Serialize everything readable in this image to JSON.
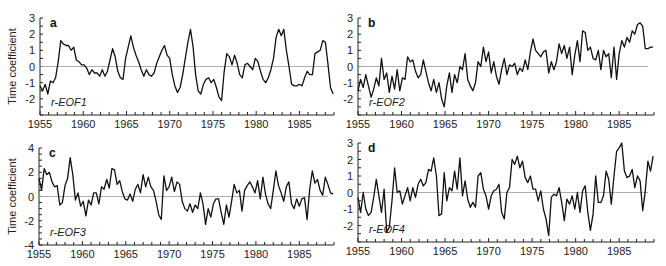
{
  "chart_data": [
    {
      "type": "line",
      "panel": "a",
      "series_label": "r-EOF1",
      "ylabel": "Time coefficient",
      "xlabel": "",
      "xlim": [
        1955,
        1989
      ],
      "ylim": [
        -3,
        3
      ],
      "xticks": [
        1955,
        1960,
        1965,
        1970,
        1975,
        1980,
        1985
      ],
      "yticks": [
        3,
        2,
        1,
        0,
        -1,
        -2
      ],
      "zero_line": true,
      "x": [
        1955.0,
        1955.3,
        1955.6,
        1955.9,
        1956.2,
        1956.5,
        1956.8,
        1957.1,
        1957.4,
        1957.7,
        1958.0,
        1958.3,
        1958.6,
        1958.9,
        1959.2,
        1959.5,
        1959.8,
        1960.1,
        1960.4,
        1960.7,
        1961.0,
        1961.3,
        1961.6,
        1961.9,
        1962.2,
        1962.5,
        1962.8,
        1963.1,
        1963.4,
        1963.7,
        1964.0,
        1964.3,
        1964.6,
        1964.9,
        1965.2,
        1965.5,
        1965.8,
        1966.1,
        1966.4,
        1966.7,
        1967.0,
        1967.3,
        1967.6,
        1967.9,
        1968.2,
        1968.5,
        1968.8,
        1969.1,
        1969.4,
        1969.7,
        1970.0,
        1970.3,
        1970.6,
        1970.9,
        1971.2,
        1971.5,
        1971.8,
        1972.1,
        1972.4,
        1972.7,
        1973.0,
        1973.3,
        1973.6,
        1973.9,
        1974.2,
        1974.5,
        1974.8,
        1975.1,
        1975.4,
        1975.7,
        1976.0,
        1976.3,
        1976.6,
        1976.9,
        1977.2,
        1977.5,
        1977.8,
        1978.1,
        1978.4,
        1978.7,
        1979.0,
        1979.3,
        1979.6,
        1979.9,
        1980.2,
        1980.5,
        1980.8,
        1981.1,
        1981.4,
        1981.7,
        1982.0,
        1982.3,
        1982.6,
        1982.9,
        1983.2,
        1983.5,
        1983.8,
        1984.1,
        1984.4,
        1984.7,
        1985.0,
        1985.3,
        1985.6,
        1985.9,
        1986.2,
        1986.5,
        1986.8,
        1987.1,
        1987.4,
        1987.7,
        1988.0,
        1988.3,
        1988.6,
        1988.9
      ],
      "values": [
        -1.2,
        -1.5,
        -1.1,
        -1.7,
        -0.9,
        -1.0,
        -0.7,
        0.3,
        1.6,
        1.4,
        1.3,
        1.3,
        1.0,
        1.2,
        0.4,
        0.3,
        0.1,
        0.1,
        -0.1,
        -0.5,
        -0.2,
        -0.4,
        -0.4,
        -0.6,
        -0.2,
        -0.6,
        -0.3,
        0.4,
        1.1,
        0.6,
        -0.3,
        -0.7,
        -0.8,
        0.5,
        1.2,
        1.9,
        1.2,
        0.7,
        0.3,
        -0.2,
        -0.6,
        -0.2,
        -0.5,
        -0.6,
        -0.4,
        0.2,
        0.6,
        1.0,
        1.3,
        0.7,
        0.5,
        -0.5,
        -1.2,
        -1.6,
        -1.3,
        -0.5,
        0.5,
        1.5,
        2.3,
        1.2,
        -0.5,
        -1.5,
        -1.7,
        -1.1,
        -0.8,
        -0.7,
        -1.0,
        -0.8,
        -1.3,
        -1.9,
        -2.1,
        -0.3,
        0.8,
        0.6,
        0.1,
        0.7,
        0.2,
        -0.5,
        -0.7,
        0.1,
        0.2,
        0.0,
        -0.2,
        0.5,
        0.3,
        -0.3,
        -0.8,
        -1.0,
        -0.7,
        -0.2,
        0.5,
        1.8,
        2.3,
        1.9,
        2.3,
        1.0,
        0.0,
        -1.1,
        -1.2,
        -1.2,
        -1.1,
        -1.2,
        -0.7,
        -0.3,
        -0.5,
        -0.5,
        0.8,
        0.9,
        1.0,
        1.6,
        1.5,
        0.2,
        -1.3,
        -1.7,
        -1.3
      ]
    },
    {
      "type": "line",
      "panel": "b",
      "series_label": "r-EOF2",
      "ylabel": "",
      "xlabel": "",
      "xlim": [
        1955,
        1989
      ],
      "ylim": [
        -3,
        3
      ],
      "xticks": [
        1955,
        1960,
        1965,
        1970,
        1975,
        1980,
        1985
      ],
      "yticks": [
        3,
        2,
        1,
        0,
        -1,
        -2
      ],
      "zero_line": true,
      "x": [
        1955.0,
        1955.3,
        1955.6,
        1955.9,
        1956.2,
        1956.5,
        1956.8,
        1957.1,
        1957.4,
        1957.7,
        1958.0,
        1958.3,
        1958.6,
        1958.9,
        1959.2,
        1959.5,
        1959.8,
        1960.1,
        1960.4,
        1960.7,
        1961.0,
        1961.3,
        1961.6,
        1961.9,
        1962.2,
        1962.5,
        1962.8,
        1963.1,
        1963.4,
        1963.7,
        1964.0,
        1964.3,
        1964.6,
        1964.9,
        1965.2,
        1965.5,
        1965.8,
        1966.1,
        1966.4,
        1966.7,
        1967.0,
        1967.3,
        1967.6,
        1967.9,
        1968.2,
        1968.5,
        1968.8,
        1969.1,
        1969.4,
        1969.7,
        1970.0,
        1970.3,
        1970.6,
        1970.9,
        1971.2,
        1971.5,
        1971.8,
        1972.1,
        1972.4,
        1972.7,
        1973.0,
        1973.3,
        1973.6,
        1973.9,
        1974.2,
        1974.5,
        1974.8,
        1975.1,
        1975.4,
        1975.7,
        1976.0,
        1976.3,
        1976.6,
        1976.9,
        1977.2,
        1977.5,
        1977.8,
        1978.1,
        1978.4,
        1978.7,
        1979.0,
        1979.3,
        1979.6,
        1979.9,
        1980.2,
        1980.5,
        1980.8,
        1981.1,
        1981.4,
        1981.7,
        1982.0,
        1982.3,
        1982.6,
        1982.9,
        1983.2,
        1983.5,
        1983.8,
        1984.1,
        1984.4,
        1984.7,
        1985.0,
        1985.3,
        1985.6,
        1985.9,
        1986.2,
        1986.5,
        1986.8,
        1987.1,
        1987.4,
        1987.7,
        1988.0,
        1988.3,
        1988.6,
        1988.9
      ],
      "values": [
        -1.5,
        -0.8,
        -1.3,
        -0.5,
        -1.2,
        -1.9,
        -1.4,
        -0.7,
        -1.2,
        0.5,
        -0.8,
        -0.4,
        -1.6,
        -0.6,
        -1.4,
        -0.2,
        -1.5,
        -0.7,
        -0.8,
        0.6,
        0.3,
        0.4,
        -0.3,
        -0.7,
        -0.5,
        0.4,
        -0.3,
        -1.0,
        -1.5,
        -0.8,
        -1.6,
        -1.0,
        -2.0,
        -2.5,
        -1.2,
        -0.4,
        -1.6,
        -0.5,
        -1.0,
        0.0,
        -0.2,
        0.8,
        -0.8,
        -1.2,
        -1.5,
        -1.0,
        0.3,
        0.0,
        1.2,
        0.3,
        0.9,
        -0.4,
        0.3,
        -0.6,
        -1.1,
        -0.2,
        0.5,
        -0.5,
        0.1,
        0.0,
        0.2,
        -0.5,
        -0.1,
        -0.3,
        0.4,
        -0.2,
        0.9,
        1.7,
        1.0,
        0.8,
        0.6,
        0.9,
        1.0,
        -0.4,
        0.3,
        -0.2,
        0.3,
        1.4,
        0.8,
        1.3,
        0.5,
        1.2,
        -0.5,
        0.7,
        1.6,
        0.3,
        2.2,
        2.1,
        1.0,
        1.2,
        0.5,
        0.4,
        1.0,
        -0.2,
        1.0,
        0.6,
        0.8,
        -0.7,
        1.2,
        -0.8,
        0.8,
        1.6,
        1.2,
        1.8,
        1.5,
        2.2,
        2.0,
        2.6,
        2.7,
        2.5,
        1.1,
        1.1,
        1.2,
        1.2
      ]
    },
    {
      "type": "line",
      "panel": "c",
      "series_label": "r-EOF3",
      "ylabel": "Time coefficient",
      "xlabel": "",
      "xlim": [
        1955,
        1989
      ],
      "ylim": [
        -4,
        4
      ],
      "xticks": [
        1955,
        1960,
        1965,
        1970,
        1975,
        1980,
        1985
      ],
      "yticks": [
        4,
        2,
        0,
        -2,
        -4
      ],
      "zero_line": true,
      "x": [
        1955.0,
        1955.3,
        1955.6,
        1955.9,
        1956.2,
        1956.5,
        1956.8,
        1957.1,
        1957.4,
        1957.7,
        1958.0,
        1958.3,
        1958.6,
        1958.9,
        1959.2,
        1959.5,
        1959.8,
        1960.1,
        1960.4,
        1960.7,
        1961.0,
        1961.3,
        1961.6,
        1961.9,
        1962.2,
        1962.5,
        1962.8,
        1963.1,
        1963.4,
        1963.7,
        1964.0,
        1964.3,
        1964.6,
        1964.9,
        1965.2,
        1965.5,
        1965.8,
        1966.1,
        1966.4,
        1966.7,
        1967.0,
        1967.3,
        1967.6,
        1967.9,
        1968.2,
        1968.5,
        1968.8,
        1969.1,
        1969.4,
        1969.7,
        1970.0,
        1970.3,
        1970.6,
        1970.9,
        1971.2,
        1971.5,
        1971.8,
        1972.1,
        1972.4,
        1972.7,
        1973.0,
        1973.3,
        1973.6,
        1973.9,
        1974.2,
        1974.5,
        1974.8,
        1975.1,
        1975.4,
        1975.7,
        1976.0,
        1976.3,
        1976.6,
        1976.9,
        1977.2,
        1977.5,
        1977.8,
        1978.1,
        1978.4,
        1978.7,
        1979.0,
        1979.3,
        1979.6,
        1979.9,
        1980.2,
        1980.5,
        1980.8,
        1981.1,
        1981.4,
        1981.7,
        1982.0,
        1982.3,
        1982.6,
        1982.9,
        1983.2,
        1983.5,
        1983.8,
        1984.1,
        1984.4,
        1984.7,
        1985.0,
        1985.3,
        1985.6,
        1985.9,
        1986.2,
        1986.5,
        1986.8,
        1987.1,
        1987.4,
        1987.7,
        1988.0,
        1988.3,
        1988.6,
        1988.9
      ],
      "values": [
        1.5,
        0.5,
        2.3,
        1.8,
        2.0,
        1.2,
        0.8,
        0.9,
        -0.7,
        -0.5,
        0.9,
        1.5,
        3.2,
        1.8,
        -0.3,
        0.3,
        -0.8,
        -0.4,
        -1.6,
        -0.3,
        -0.7,
        0.3,
        0.3,
        -0.6,
        0.8,
        0.6,
        1.4,
        0.7,
        2.3,
        2.2,
        1.0,
        1.3,
        0.4,
        -0.2,
        -0.3,
        0.2,
        -0.4,
        0.6,
        1.0,
        0.3,
        1.8,
        0.8,
        1.6,
        0.8,
        0.5,
        -0.4,
        -1.5,
        -1.9,
        1.7,
        0.5,
        0.8,
        1.6,
        0.4,
        1.2,
        1.0,
        -0.4,
        -1.0,
        -1.2,
        -0.6,
        -1.3,
        -0.7,
        -1.0,
        0.3,
        -0.6,
        -2.3,
        -1.0,
        -1.7,
        -0.6,
        -0.2,
        -0.2,
        -1.3,
        -2.3,
        -0.7,
        -1.7,
        -0.4,
        1.0,
        0.3,
        0.5,
        -1.2,
        0.5,
        0.9,
        1.2,
        0.8,
        0.3,
        1.3,
        -0.2,
        1.6,
        0.2,
        -0.6,
        -1.0,
        0.5,
        2.1,
        0.9,
        0.3,
        -0.4,
        0.8,
        1.2,
        -0.6,
        -1.0,
        -0.2,
        -0.8,
        -0.2,
        -0.1,
        -1.9,
        0.6,
        2.1,
        1.1,
        1.4,
        0.5,
        0.1,
        1.6,
        1.0,
        0.3,
        0.2
      ]
    },
    {
      "type": "line",
      "panel": "d",
      "series_label": "r-EOF4",
      "ylabel": "",
      "xlabel": "",
      "xlim": [
        1955,
        1989
      ],
      "ylim": [
        -3,
        3
      ],
      "xticks": [
        1955,
        1960,
        1965,
        1970,
        1975,
        1980,
        1985
      ],
      "yticks": [
        3,
        2,
        1,
        0,
        -1,
        -2
      ],
      "zero_line": true,
      "x": [
        1955.0,
        1955.3,
        1955.6,
        1955.9,
        1956.2,
        1956.5,
        1956.8,
        1957.1,
        1957.4,
        1957.7,
        1958.0,
        1958.3,
        1958.6,
        1958.9,
        1959.2,
        1959.5,
        1959.8,
        1960.1,
        1960.4,
        1960.7,
        1961.0,
        1961.3,
        1961.6,
        1961.9,
        1962.2,
        1962.5,
        1962.8,
        1963.1,
        1963.4,
        1963.7,
        1964.0,
        1964.3,
        1964.6,
        1964.9,
        1965.2,
        1965.5,
        1965.8,
        1966.1,
        1966.4,
        1966.7,
        1967.0,
        1967.3,
        1967.6,
        1967.9,
        1968.2,
        1968.5,
        1968.8,
        1969.1,
        1969.4,
        1969.7,
        1970.0,
        1970.3,
        1970.6,
        1970.9,
        1971.2,
        1971.5,
        1971.8,
        1972.1,
        1972.4,
        1972.7,
        1973.0,
        1973.3,
        1973.6,
        1973.9,
        1974.2,
        1974.5,
        1974.8,
        1975.1,
        1975.4,
        1975.7,
        1976.0,
        1976.3,
        1976.6,
        1976.9,
        1977.2,
        1977.5,
        1977.8,
        1978.1,
        1978.4,
        1978.7,
        1979.0,
        1979.3,
        1979.6,
        1979.9,
        1980.2,
        1980.5,
        1980.8,
        1981.1,
        1981.4,
        1981.7,
        1982.0,
        1982.3,
        1982.6,
        1982.9,
        1983.2,
        1983.5,
        1983.8,
        1984.1,
        1984.4,
        1984.7,
        1985.0,
        1985.3,
        1985.6,
        1985.9,
        1986.2,
        1986.5,
        1986.8,
        1987.1,
        1987.4,
        1987.7,
        1988.0,
        1988.3,
        1988.6,
        1988.9
      ],
      "values": [
        -0.3,
        -1.2,
        0.0,
        -1.0,
        -1.4,
        -1.2,
        -0.3,
        0.8,
        -0.2,
        -1.2,
        0.2,
        -2.4,
        -2.1,
        -0.5,
        1.5,
        0.0,
        0.1,
        -0.7,
        -0.2,
        0.3,
        -0.5,
        0.3,
        -0.3,
        0.5,
        0.8,
        0.4,
        0.6,
        1.4,
        1.3,
        2.1,
        1.0,
        -1.4,
        -1.3,
        1.2,
        -0.5,
        0.3,
        0.1,
        1.3,
        0.2,
        2.1,
        -0.2,
        0.7,
        -0.4,
        -0.9,
        -0.6,
        -0.9,
        1.0,
        1.2,
        0.2,
        -0.2,
        -1.0,
        -0.2,
        0.1,
        0.2,
        0.5,
        -1.2,
        -1.6,
        0.0,
        0.3,
        2.0,
        1.7,
        2.2,
        1.5,
        1.9,
        0.9,
        0.6,
        1.0,
        0.2,
        0.2,
        -0.5,
        0.1,
        -1.0,
        -1.6,
        -2.6,
        -0.3,
        -0.1,
        -0.2,
        0.3,
        -0.6,
        -1.7,
        -0.4,
        -0.7,
        -0.2,
        -1.0,
        0.0,
        -1.2,
        0.1,
        0.4,
        -1.2,
        -2.3,
        -1.3,
        1.0,
        -0.6,
        -0.6,
        -0.2,
        1.3,
        0.8,
        -0.7,
        1.0,
        2.5,
        2.7,
        3.0,
        1.3,
        0.9,
        1.0,
        1.4,
        0.3,
        1.0,
        0.7,
        -1.1,
        0.1,
        1.9,
        1.3,
        2.2,
        1.5
      ]
    }
  ],
  "panels": {
    "a": {
      "letter": "a",
      "series_label": "r-EOF1",
      "ylabel": "Time coefficient"
    },
    "b": {
      "letter": "b",
      "series_label": "r-EOF2",
      "ylabel": ""
    },
    "c": {
      "letter": "c",
      "series_label": "r-EOF3",
      "ylabel": "Time coefficient"
    },
    "d": {
      "letter": "d",
      "series_label": "r-EOF4",
      "ylabel": ""
    }
  },
  "colors": {
    "line": "#111111",
    "zero_line": "#9a9a9a",
    "axis": "#222222"
  }
}
